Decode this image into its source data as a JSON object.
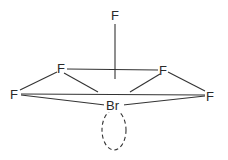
{
  "diagram": {
    "molecule": "BrF5",
    "geometry": "square pyramidal",
    "central_atom": {
      "label": "Br",
      "x": 113,
      "y": 109
    },
    "atoms": [
      {
        "id": "f-axial",
        "label": "F",
        "x": 115,
        "y": 20
      },
      {
        "id": "f-back-left",
        "label": "F",
        "x": 61,
        "y": 73
      },
      {
        "id": "f-back-right",
        "label": "F",
        "x": 163,
        "y": 75
      },
      {
        "id": "f-front-left",
        "label": "F",
        "x": 14,
        "y": 98
      },
      {
        "id": "f-front-right",
        "label": "F",
        "x": 210,
        "y": 100
      }
    ],
    "lone_pair": {
      "label": "lone pair",
      "cx": 114,
      "cy": 130,
      "rx": 12,
      "ry": 20
    },
    "colors": {
      "line": "#333333",
      "text": "#2a2a2a",
      "background": "#ffffff"
    }
  }
}
